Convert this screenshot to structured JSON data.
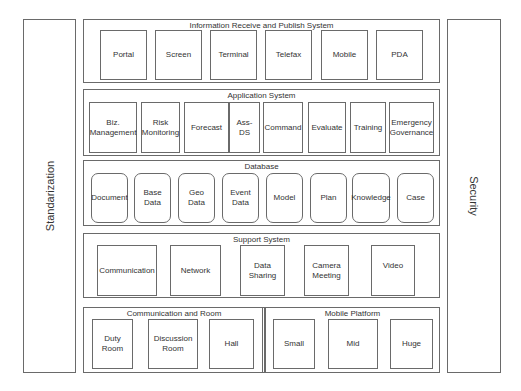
{
  "side_panels": {
    "left": "Standarization",
    "right": "Security"
  },
  "layers": {
    "info": {
      "title": "Information Receive and Publish System",
      "items": [
        "Portal",
        "Screen",
        "Terminal",
        "Telefax",
        "Mobile",
        "PDA"
      ]
    },
    "application": {
      "title": "Application System",
      "items": [
        "Biz.\nManagement",
        "Risk\nMonitoring",
        "Forecast",
        "Ass-\nDS",
        "Command",
        "Evaluate",
        "Training",
        "Emergency\nGovernance"
      ]
    },
    "database": {
      "title": "Database",
      "items": [
        "Document",
        "Base\nData",
        "Geo\nData",
        "Event\nData",
        "Model",
        "Plan",
        "Knowledge",
        "Case"
      ]
    },
    "support": {
      "title": "Support System",
      "items": [
        "Communication",
        "Network",
        "Data\nSharing",
        "Camera\nMeeting",
        "Video"
      ]
    },
    "comm_room": {
      "title": "Communication and Room",
      "items": [
        "Duty\nRoom",
        "Discussion\nRoom",
        "Hall"
      ]
    },
    "mobile_platform": {
      "title": "Mobile Platform",
      "items": [
        "Small",
        "Mid",
        "Huge"
      ]
    }
  }
}
